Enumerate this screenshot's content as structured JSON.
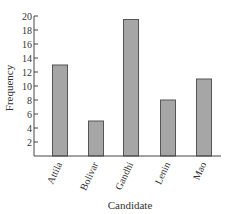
{
  "chart_data": {
    "type": "bar",
    "title": "",
    "xlabel": "Candidate",
    "ylabel": "Frequency",
    "categories": [
      "Attila",
      "Bolivar",
      "Gandhi",
      "Lenin",
      "Mao"
    ],
    "values": [
      13,
      5,
      19.5,
      8,
      11
    ],
    "ylim": [
      0,
      20
    ],
    "yticks": [
      2,
      4,
      6,
      8,
      10,
      12,
      14,
      16,
      18,
      20
    ],
    "grid": false,
    "legend": null,
    "bar_color": "#a6a6a6",
    "bar_edge_color": "#555555",
    "axis_color": "#444444"
  }
}
